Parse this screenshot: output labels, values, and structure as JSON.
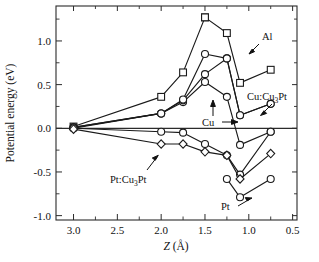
{
  "figure": {
    "background": "#ffffff",
    "ink_color": "#1a1a1a"
  },
  "axes": {
    "x_title_main": "Z",
    "x_title_unit": "(Å)",
    "y_title": "Potential energy (eV)",
    "x_ticks": [
      "3.0",
      "2.5",
      "2.0",
      "1.5",
      "1.0",
      "0.5"
    ],
    "x_tick_values": [
      3.0,
      2.5,
      2.0,
      1.5,
      1.0,
      0.5
    ],
    "y_ticks": [
      "1.0",
      "0.5",
      "0.0",
      "-0.5",
      "-1.0"
    ],
    "y_tick_values": [
      1.0,
      0.5,
      0.0,
      -0.5,
      -1.0
    ],
    "x_minor_values": [
      2.75,
      2.25,
      1.75,
      1.25,
      0.75
    ],
    "y_minor_values": [
      1.25,
      0.75,
      0.25,
      -0.25,
      -0.75
    ],
    "xlim": [
      3.2,
      0.45
    ],
    "ylim": [
      -1.05,
      1.4
    ],
    "x_reversed": true,
    "grid": "off",
    "frame": "box"
  },
  "annotations": [
    {
      "id": "al",
      "text": "Al",
      "sub": "",
      "tail": "Al"
    },
    {
      "id": "cu",
      "text": "Cu",
      "sub": "",
      "tail": ""
    },
    {
      "id": "cucu3pt",
      "text": "Cu:Cu",
      "sub": "3",
      "tail": "Pt"
    },
    {
      "id": "ptcu3pt",
      "text": "Pt:Cu",
      "sub": "3",
      "tail": "Pt"
    },
    {
      "id": "pt",
      "text": "Pt",
      "sub": "",
      "tail": ""
    }
  ],
  "chart_data": {
    "type": "line",
    "title": "",
    "xlabel": "Z (Å)",
    "ylabel": "Potential energy (eV)",
    "xlim": [
      3.2,
      0.45
    ],
    "ylim": [
      -1.05,
      1.4
    ],
    "x_reversed": true,
    "grid": "off",
    "legend_position": "inline-annotations",
    "series": [
      {
        "name": "Al",
        "marker": "square",
        "x": [
          3.0,
          2.0,
          1.75,
          1.5,
          1.5,
          1.25,
          1.1,
          0.75
        ],
        "y": [
          0.02,
          0.36,
          0.64,
          1.27,
          1.27,
          1.09,
          0.52,
          0.67
        ]
      },
      {
        "name": "Cu",
        "marker": "circle",
        "x": [
          3.0,
          2.0,
          1.75,
          1.5,
          1.25,
          1.1,
          0.75
        ],
        "y": [
          0.0,
          0.17,
          0.3,
          0.53,
          0.36,
          -0.19,
          -0.04
        ]
      },
      {
        "name": "Cu:Cu3Pt",
        "marker": "circle",
        "x": [
          3.0,
          2.0,
          1.75,
          1.5,
          1.25,
          1.1,
          0.75
        ],
        "y": [
          0.01,
          0.17,
          0.32,
          0.62,
          0.8,
          0.15,
          0.28
        ]
      },
      {
        "name": "Cu-upper",
        "marker": "circle",
        "x": [
          3.0,
          2.0,
          1.75,
          1.5,
          1.25,
          1.1,
          0.75
        ],
        "y": [
          0.01,
          0.17,
          0.33,
          0.85,
          0.8,
          0.15,
          0.28
        ]
      },
      {
        "name": "Pt:Cu3Pt",
        "marker": "circle",
        "x": [
          3.0,
          2.0,
          1.75,
          1.5,
          1.25,
          1.1,
          0.75
        ],
        "y": [
          0.0,
          -0.04,
          -0.05,
          -0.18,
          -0.31,
          -0.53,
          -0.04
        ]
      },
      {
        "name": "Pt",
        "marker": "diamond",
        "x": [
          3.0,
          2.0,
          1.75,
          1.5,
          1.25,
          1.1,
          0.75
        ],
        "y": [
          -0.01,
          -0.18,
          -0.18,
          -0.27,
          -0.31,
          -0.58,
          -0.29
        ]
      },
      {
        "name": "Pt-lower",
        "marker": "circle",
        "x": [
          1.25,
          1.1,
          0.75
        ],
        "y": [
          -0.58,
          -0.79,
          -0.58
        ]
      }
    ]
  }
}
